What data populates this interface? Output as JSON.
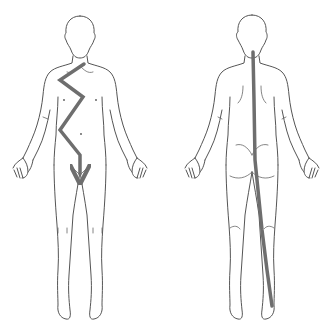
{
  "figures": [
    {
      "id": "front",
      "view": "anterior",
      "path": {
        "type": "zigzag-arrow",
        "points": [
          [
            84,
            64
          ],
          [
            60,
            80
          ],
          [
            83,
            97
          ],
          [
            60,
            130
          ],
          [
            80,
            155
          ],
          [
            80,
            174
          ]
        ],
        "arrowhead_at_end": true
      }
    },
    {
      "id": "back",
      "view": "posterior",
      "path": {
        "type": "line",
        "points": [
          [
            253,
            52
          ],
          [
            254,
            100
          ],
          [
            255,
            160
          ],
          [
            262,
            230
          ],
          [
            267,
            270
          ],
          [
            272,
            306
          ]
        ],
        "arrowhead_at_end": false
      }
    }
  ],
  "colors": {
    "background": "#ffffff",
    "outline": "#555555",
    "path": "#6e6e6e"
  },
  "path_stroke_width": 3.5
}
